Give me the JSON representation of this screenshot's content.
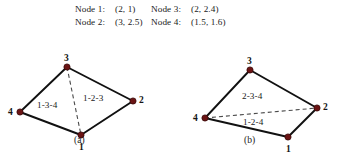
{
  "legend": {
    "rows": [
      {
        "label1": "Node 1:",
        "value1": "(2, 1)",
        "label2": "Node 3:",
        "value2": "(2, 2.4)"
      },
      {
        "label1": "Node 2:",
        "value1": "(3, 2.5)",
        "label2": "Node 4:",
        "value2": "(1.5, 1.6)"
      }
    ]
  },
  "colors": {
    "node_fill": "#6b1414",
    "node_stroke": "#3a0a0a",
    "edge": "#111111",
    "dashed_edge": "#4a4a4a",
    "text": "#1a1a1a"
  },
  "diagrams": [
    {
      "id": "a",
      "caption": "(a)",
      "nodes": [
        {
          "id": "1",
          "label": "1",
          "x": 81,
          "y": 110,
          "label_dx": -2,
          "label_dy": 7
        },
        {
          "id": "2",
          "label": "2",
          "x": 133,
          "y": 76,
          "label_dx": 6,
          "label_dy": -6
        },
        {
          "id": "3",
          "label": "3",
          "x": 67,
          "y": 42,
          "label_dx": -3,
          "label_dy": -14
        },
        {
          "id": "4",
          "label": "4",
          "x": 20,
          "y": 87,
          "label_dx": -12,
          "label_dy": -5
        }
      ],
      "solid_edges": [
        [
          "3",
          "4"
        ],
        [
          "4",
          "1"
        ],
        [
          "1",
          "2"
        ],
        [
          "2",
          "3"
        ]
      ],
      "dashed_edges": [
        [
          "3",
          "1"
        ]
      ],
      "regions": [
        {
          "label": "1-3-4",
          "x": 37,
          "y": 75
        },
        {
          "label": "1-2-3",
          "x": 83,
          "y": 68
        }
      ]
    },
    {
      "id": "b",
      "caption": "(b)",
      "nodes": [
        {
          "id": "1",
          "label": "1",
          "x": 118,
          "y": 112,
          "label_dx": -2,
          "label_dy": 7
        },
        {
          "id": "2",
          "label": "2",
          "x": 147,
          "y": 83,
          "label_dx": 6,
          "label_dy": -6
        },
        {
          "id": "3",
          "label": "3",
          "x": 80,
          "y": 45,
          "label_dx": -3,
          "label_dy": -14
        },
        {
          "id": "4",
          "label": "4",
          "x": 35,
          "y": 93,
          "label_dx": -12,
          "label_dy": -5
        }
      ],
      "solid_edges": [
        [
          "3",
          "4"
        ],
        [
          "4",
          "1"
        ],
        [
          "1",
          "2"
        ],
        [
          "2",
          "3"
        ]
      ],
      "dashed_edges": [
        [
          "4",
          "2"
        ]
      ],
      "regions": [
        {
          "label": "2-3-4",
          "x": 72,
          "y": 66
        },
        {
          "label": "1-2-4",
          "x": 73,
          "y": 92
        }
      ]
    }
  ]
}
